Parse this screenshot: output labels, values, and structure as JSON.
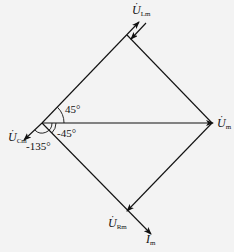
{
  "diagram": {
    "type": "phasor-diagram",
    "labels": {
      "u_lm": {
        "symbol": "U",
        "subscript": "Lm",
        "dot": "·"
      },
      "u_m": {
        "symbol": "U",
        "subscript": "m",
        "dot": "·"
      },
      "u_cm": {
        "symbol": "U",
        "subscript": "Cm",
        "dot": "·"
      },
      "u_rm": {
        "symbol": "U",
        "subscript": "Rm",
        "dot": "·"
      },
      "i_m": {
        "symbol": "I",
        "subscript": "m",
        "dot": "·"
      }
    },
    "angles": {
      "a1": "45°",
      "a2": "-45°",
      "a3": "-135°"
    },
    "colors": {
      "line": "#111111",
      "background": "#f3f3f3"
    }
  }
}
